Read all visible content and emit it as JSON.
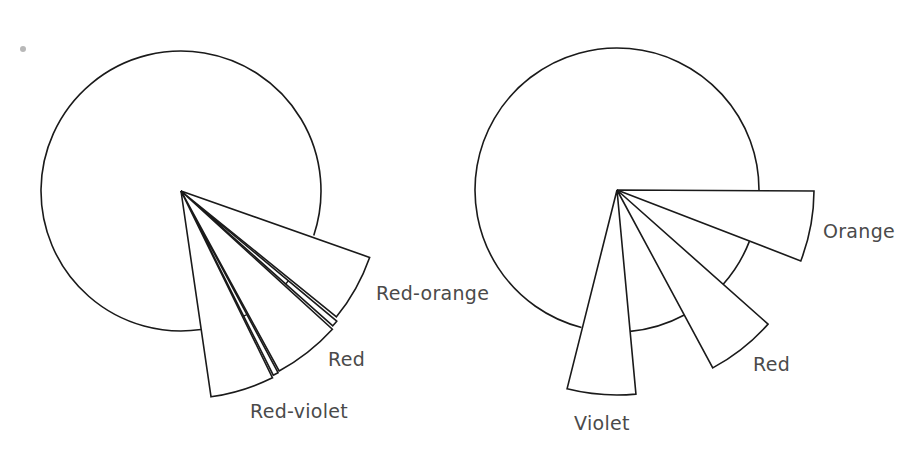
{
  "figure": {
    "diagrams": [
      {
        "id": "left",
        "center": [
          181,
          191
        ],
        "circle_radius": 140,
        "circle_arc_deg": [
          81.8,
          18.5
        ],
        "wedges": [
          {
            "label": "Red-orange",
            "start_deg": 19.4,
            "end_deg": 39.0,
            "radius": 200,
            "label_pos": [
              376,
              284
            ]
          },
          {
            "label": "Red",
            "start_deg": 42.4,
            "end_deg": 61.4,
            "radius": 205,
            "label_pos": [
              328,
              350
            ]
          },
          {
            "label": "Red-violet",
            "start_deg": 63.9,
            "end_deg": 81.7,
            "radius": 208,
            "label_pos": [
              250,
              402
            ]
          }
        ],
        "strips": [
          {
            "start_deg": 39.9,
            "end_deg": 41.6,
            "radius": 203,
            "tick_radius": 140
          },
          {
            "start_deg": 61.9,
            "end_deg": 63.4,
            "radius": 206,
            "tick_radius": 140
          }
        ]
      },
      {
        "id": "right",
        "center": [
          617,
          190
        ],
        "circle_radius": 142,
        "circle_arc_deg": [
          104.5,
          0.3
        ],
        "gap_arcs_deg": [
          [
            21.1,
            41.6
          ],
          [
            61.7,
            84.7
          ]
        ],
        "wedges": [
          {
            "label": "Orange",
            "start_deg": 0.3,
            "end_deg": 21.1,
            "radius": 197,
            "label_pos": [
              823,
              222
            ]
          },
          {
            "label": "Red",
            "start_deg": 41.6,
            "end_deg": 61.7,
            "radius": 202,
            "label_pos": [
              753,
              355
            ]
          },
          {
            "label": "Violet",
            "start_deg": 84.7,
            "end_deg": 104.1,
            "radius": 205,
            "label_pos": [
              574,
              414
            ]
          }
        ],
        "strips": []
      }
    ],
    "stray_mark": {
      "pos": [
        20,
        46
      ]
    },
    "colors": {
      "stroke": "#1a1a1a",
      "label": "#4a4a4a",
      "background": "#ffffff"
    }
  }
}
